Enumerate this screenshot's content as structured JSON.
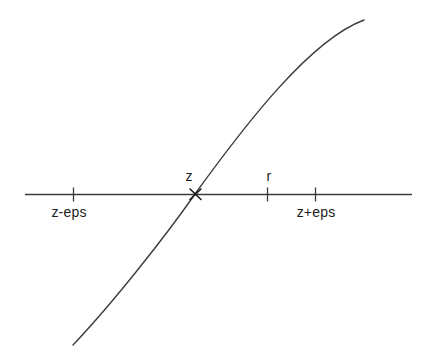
{
  "figure": {
    "colors": {
      "background": "#ffffff",
      "line": "#3c3c3c",
      "marker": "#1a1a1a",
      "text": "#1c1c1c"
    },
    "labels": {
      "root": "z",
      "point_r": "r",
      "left_endpoint": "z-eps",
      "right_endpoint": "z+eps"
    },
    "root_marker": "x-cross",
    "ticks": [
      {
        "label": "z-eps",
        "side": "below-axis"
      },
      {
        "label": "r",
        "side": "above-axis"
      },
      {
        "label": "z+eps",
        "side": "below-axis"
      }
    ]
  }
}
